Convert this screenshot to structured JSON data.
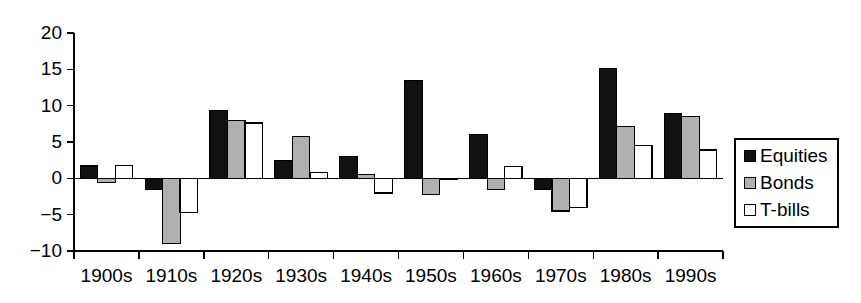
{
  "chart_data": {
    "type": "bar",
    "title": "",
    "subtitle": "",
    "xlabel": "",
    "ylabel": "",
    "categories": [
      "1900s",
      "1910s",
      "1920s",
      "1930s",
      "1940s",
      "1950s",
      "1960s",
      "1970s",
      "1980s",
      "1990s"
    ],
    "series": [
      {
        "name": "Equities",
        "color": "#111111",
        "values": [
          1.7,
          -1.5,
          9.3,
          2.4,
          3.0,
          13.5,
          6.0,
          -1.5,
          15.1,
          8.9
        ]
      },
      {
        "name": "Bonds",
        "color": "#b0b0b0",
        "values": [
          -0.6,
          -9.0,
          8.0,
          5.8,
          0.5,
          -2.2,
          -1.5,
          -4.5,
          7.1,
          8.5
        ]
      },
      {
        "name": "T-bills",
        "color": "#ffffff",
        "values": [
          1.8,
          -4.7,
          7.6,
          0.8,
          -2.0,
          -0.2,
          1.6,
          -4.0,
          4.5,
          3.9
        ]
      }
    ],
    "ylim": [
      -10,
      20
    ],
    "yticks": [
      20,
      15,
      10,
      5,
      0,
      -5,
      -10
    ],
    "ytick_labels": [
      "20",
      "15",
      "10",
      "5",
      "0",
      "−5",
      "−10"
    ],
    "grid": false,
    "legend_position": "right",
    "legend_entries": [
      {
        "label": "Equities",
        "swatch": "solid-black-square"
      },
      {
        "label": "Bonds",
        "swatch": "solid-gray-square"
      },
      {
        "label": "T-bills",
        "swatch": "open-white-square"
      }
    ]
  }
}
